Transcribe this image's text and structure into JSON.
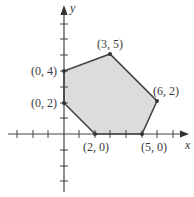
{
  "diagram": {
    "type": "feasible-region",
    "axes": {
      "x_label": "x",
      "y_label": "y",
      "x_ticks": [
        -3,
        -2,
        -1,
        1,
        2,
        3,
        4,
        5,
        6,
        7
      ],
      "y_ticks": [
        -3,
        -2,
        -1,
        1,
        2,
        3,
        4,
        5,
        6,
        7
      ]
    },
    "region": {
      "fill_color": "#dcdcdc",
      "edge_color": "#444444",
      "vertices": [
        {
          "x": 0,
          "y": 2,
          "label": "(0, 2)"
        },
        {
          "x": 0,
          "y": 4,
          "label": "(0, 4)"
        },
        {
          "x": 3,
          "y": 5,
          "label": "(3, 5)"
        },
        {
          "x": 6,
          "y": 2,
          "label": "(6, 2)"
        },
        {
          "x": 5,
          "y": 0,
          "label": "(5, 0)"
        },
        {
          "x": 2,
          "y": 0,
          "label": "(2, 0)"
        }
      ]
    }
  }
}
